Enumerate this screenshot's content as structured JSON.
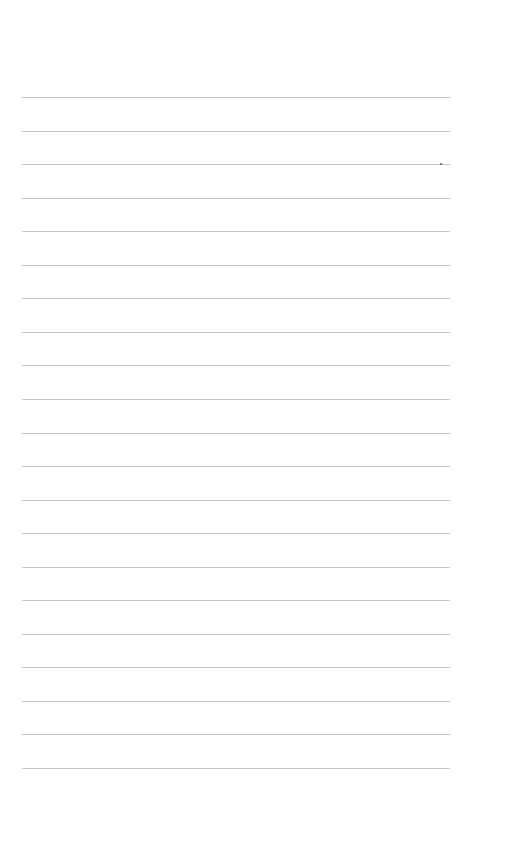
{
  "page": {
    "type": "lined-paper",
    "background_color": "#ffffff",
    "rule_color": "#c4c4c4",
    "rule_count": 21,
    "first_rule_y": 97,
    "rule_spacing": 33.55,
    "rule_left": 22,
    "rule_width": 428
  }
}
